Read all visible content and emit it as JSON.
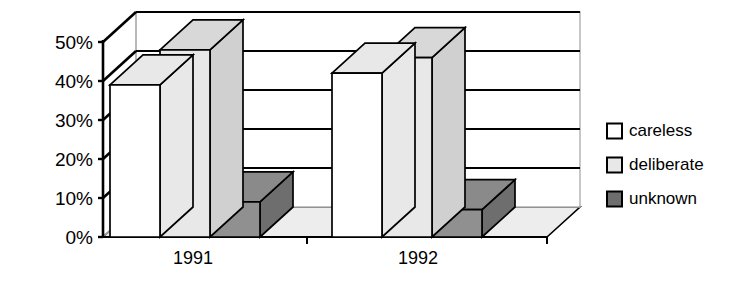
{
  "chart_data": {
    "type": "bar",
    "title": "",
    "subtitle": "",
    "xlabel": "",
    "ylabel": "",
    "categories": [
      "1991",
      "1992"
    ],
    "series": [
      {
        "name": "careless",
        "values": [
          39,
          42
        ],
        "color": "#ffffff"
      },
      {
        "name": "deliberate",
        "values": [
          48,
          46
        ],
        "color": "#e8e8e8"
      },
      {
        "name": "unknown",
        "values": [
          9,
          7
        ],
        "color": "#909090"
      }
    ],
    "ylim": [
      0,
      50
    ],
    "ytick_values": [
      0,
      10,
      20,
      30,
      40,
      50
    ],
    "ytick_labels": [
      "0%",
      "10%",
      "20%",
      "30%",
      "40%",
      "50%"
    ],
    "value_suffix": "%",
    "grid": true,
    "grid_axis": "y",
    "legend_position": "right",
    "projection": "3d",
    "annotations": []
  },
  "axes": {
    "y_ticks": [
      {
        "label": "50%",
        "value": 50
      },
      {
        "label": "40%",
        "value": 40
      },
      {
        "label": "30%",
        "value": 30
      },
      {
        "label": "20%",
        "value": 20
      },
      {
        "label": "10%",
        "value": 10
      },
      {
        "label": "0%",
        "value": 0
      }
    ],
    "x_ticks": [
      {
        "label": "1991"
      },
      {
        "label": "1992"
      }
    ]
  },
  "legend": {
    "items": [
      {
        "label": "careless",
        "swatch": "#ffffff"
      },
      {
        "label": "deliberate",
        "swatch": "#e8e8e8"
      },
      {
        "label": "unknown",
        "swatch": "#6e6e6e"
      }
    ]
  },
  "colors": {
    "careless_front": "#ffffff",
    "careless_top": "#e8e8e8",
    "careless_side": "#e8e8e8",
    "deliberate_front": "#e8e8e8",
    "deliberate_top": "#d8d8d8",
    "deliberate_side": "#d0d0d0",
    "unknown_front": "#909090",
    "unknown_top": "#8a8a8a",
    "unknown_side": "#6e6e6e",
    "floor": "#ededed",
    "wall": "#ffffff",
    "outline": "#000000",
    "grid_line": "#000000",
    "back_edge": "#b0b0b0"
  }
}
